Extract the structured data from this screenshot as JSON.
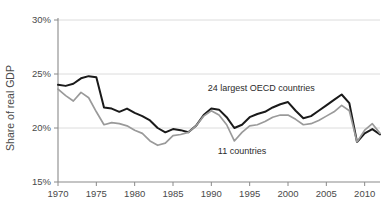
{
  "chart_data": {
    "type": "line",
    "title": "",
    "subtitle": "",
    "xlabel": "",
    "ylabel": "Share of real GDP",
    "xlim": [
      1970,
      2012
    ],
    "ylim": [
      15,
      30
    ],
    "grid": true,
    "grid_axis": "y",
    "legend_position": "inline-annotations",
    "y_tick_labels": [
      "15%",
      "20%",
      "25%",
      "30%"
    ],
    "y_ticks": [
      15,
      20,
      25,
      30
    ],
    "x_tick_labels": [
      "1970",
      "1975",
      "1980",
      "1985",
      "1990",
      "1995",
      "2000",
      "2005",
      "2010"
    ],
    "x_ticks": [
      1970,
      1975,
      1980,
      1985,
      1990,
      1995,
      2000,
      2005,
      2010
    ],
    "x": [
      1970,
      1971,
      1972,
      1973,
      1974,
      1975,
      1976,
      1977,
      1978,
      1979,
      1980,
      1981,
      1982,
      1983,
      1984,
      1985,
      1986,
      1987,
      1988,
      1989,
      1990,
      1991,
      1992,
      1993,
      1994,
      1995,
      1996,
      1997,
      1998,
      1999,
      2000,
      2001,
      2002,
      2003,
      2004,
      2005,
      2006,
      2007,
      2008,
      2009,
      2010,
      2011,
      2012
    ],
    "series": [
      {
        "name": "24 largest OECD countries",
        "color": "#1a1a1a",
        "width": 2.0,
        "label_x": 1996.5,
        "label_y": 23.4,
        "values": [
          24.0,
          23.9,
          24.1,
          24.6,
          24.8,
          24.7,
          21.9,
          21.8,
          21.5,
          21.8,
          21.4,
          21.1,
          20.7,
          20.0,
          19.6,
          19.9,
          19.8,
          19.6,
          20.2,
          21.2,
          21.8,
          21.7,
          21.0,
          20.0,
          20.3,
          21.0,
          21.3,
          21.5,
          21.9,
          22.2,
          22.4,
          21.6,
          20.9,
          21.1,
          21.6,
          22.1,
          22.6,
          23.1,
          22.3,
          18.7,
          19.5,
          19.9,
          19.4
        ]
      },
      {
        "name": "11 countries",
        "color": "#9a9a9a",
        "width": 1.7,
        "label_x": 1994.0,
        "label_y": 17.6,
        "values": [
          23.6,
          23.0,
          22.5,
          23.3,
          22.8,
          21.5,
          20.3,
          20.5,
          20.4,
          20.2,
          19.8,
          19.5,
          18.8,
          18.4,
          18.6,
          19.3,
          19.4,
          19.6,
          20.2,
          21.1,
          21.6,
          21.2,
          20.3,
          18.8,
          19.6,
          20.2,
          20.3,
          20.6,
          21.0,
          21.2,
          21.2,
          20.8,
          20.3,
          20.4,
          20.7,
          21.1,
          21.5,
          22.1,
          21.6,
          18.7,
          19.8,
          20.4,
          19.5
        ]
      }
    ]
  },
  "labels": {
    "y_axis_title": "Share of real GDP",
    "series_black": "24 largest OECD countries",
    "series_gray": "11 countries"
  }
}
